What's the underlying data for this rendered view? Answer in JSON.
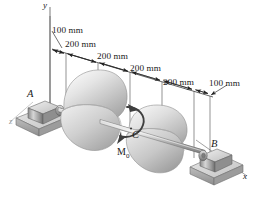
{
  "figure": {
    "kind": "engineering-mechanics-shaft-diagram"
  },
  "axes": {
    "y_label": "y",
    "x_label": "x",
    "z_label": "z"
  },
  "supports": {
    "left_label": "A",
    "right_label": "B"
  },
  "torque": {
    "point_label": "C",
    "moment_label": "M",
    "moment_subscript": "0"
  },
  "dimensions": [
    {
      "id": "d1",
      "text": "100 mm"
    },
    {
      "id": "d2",
      "text": "200 mm"
    },
    {
      "id": "d3",
      "text": "200 mm"
    },
    {
      "id": "d4",
      "text": "200 mm"
    },
    {
      "id": "d5",
      "text": "200 mm"
    },
    {
      "id": "d6",
      "text": "100 mm"
    }
  ],
  "colors": {
    "line": "#222222",
    "shaft": "#9d9d9d",
    "pulley_light": "#f2f2f2",
    "pulley_mid": "#c9c9c9",
    "pulley_dark": "#8f8f8f",
    "support_light": "#e3e3e3",
    "support_dark": "#707070",
    "background": "#ffffff",
    "faint_axis": "#9a9a9a"
  }
}
